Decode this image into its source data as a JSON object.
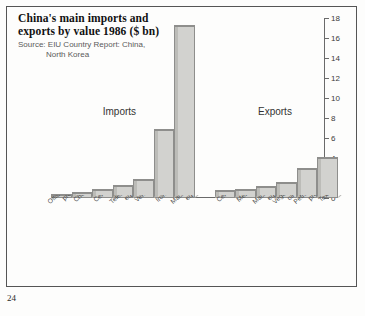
{
  "page_number": "24",
  "chart_data": {
    "type": "bar",
    "title": "China's main imports and exports by value 1986 ($ bn)",
    "title_line1": "China's main imports and",
    "title_line2": "exports by value 1986 ($ bn)",
    "source_label": "Source:",
    "source_line1": "Source: EIU Country Report: China,",
    "source_line2": "North Korea",
    "xlabel": "",
    "ylabel": "",
    "ylim": [
      0,
      18
    ],
    "yticks": [
      0,
      2,
      4,
      6,
      8,
      10,
      12,
      14,
      16,
      18
    ],
    "ytick_labels": [
      "0",
      "2",
      "4",
      "6",
      "8",
      "10",
      "12",
      "14",
      "16",
      "18"
    ],
    "grid": false,
    "legend": "none",
    "group_labels": [
      "Imports",
      "Exports"
    ],
    "groups": [
      {
        "name": "Imports",
        "categories": [
          "Office machines and data processors",
          "Chemical fertilizers",
          "Cereals",
          "Telecommunications equipment",
          "Vehicles",
          "Iron and steel",
          "Machinery and transport equipment"
        ],
        "category_lines": [
          [
            "Office machines and data",
            "processors"
          ],
          [
            "Chemical fertilizers",
            ""
          ],
          [
            "Cereals",
            ""
          ],
          [
            "Telecommunications",
            "equipment"
          ],
          [
            "Vehicles",
            ""
          ],
          [
            "Iron and steel",
            ""
          ],
          [
            "Machinery and transport",
            "equipment"
          ]
        ],
        "values": [
          0.4,
          0.6,
          0.9,
          1.3,
          1.9,
          6.9,
          17.3
        ]
      },
      {
        "name": "Exports",
        "categories": [
          "Cereals",
          "Metals manufactures",
          "Machinery and transport equipment",
          "Vegetables, fruits and oil seeds",
          "Petroleum and related products",
          "Textiles, clothing and yarn"
        ],
        "category_lines": [
          [
            "Cereals",
            ""
          ],
          [
            "Metals manufactures",
            ""
          ],
          [
            "Machinery and transport",
            "equipment"
          ],
          [
            "Vegetables, fruits and",
            "oil seeds"
          ],
          [
            "Petroleum and related",
            "products"
          ],
          [
            "Textiles, clothing and yarn",
            ""
          ]
        ],
        "values": [
          0.8,
          0.9,
          1.2,
          1.6,
          3.0,
          4.1
        ]
      }
    ]
  },
  "colors": {
    "bar_face": "#d2d2cf",
    "bar_side": "#bcbcb8",
    "bar_edge": "#8e8e8c",
    "axis": "#6a6a6a",
    "frame": "#555555",
    "text": "#333333",
    "source_text": "#5a5a5a",
    "background": "#fdfdfc"
  }
}
